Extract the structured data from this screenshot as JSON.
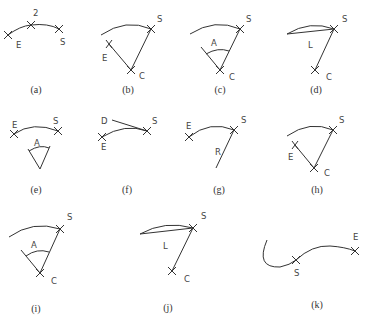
{
  "figure": {
    "panels": [
      {
        "id": "a",
        "caption": "(a)",
        "labels": {
          "p1": "E",
          "p2": "2",
          "p3": "S"
        }
      },
      {
        "id": "b",
        "caption": "(b)",
        "labels": {
          "s": "S",
          "e": "E",
          "c": "C"
        }
      },
      {
        "id": "c",
        "caption": "(c)",
        "labels": {
          "s": "S",
          "a": "A",
          "c": "C"
        }
      },
      {
        "id": "d",
        "caption": "(d)",
        "labels": {
          "s": "S",
          "l": "L",
          "c": "C"
        }
      },
      {
        "id": "e",
        "caption": "(e)",
        "labels": {
          "e": "E",
          "s": "S",
          "a": "A"
        }
      },
      {
        "id": "f",
        "caption": "(f)",
        "labels": {
          "d": "D",
          "s": "S",
          "e": "E"
        }
      },
      {
        "id": "g",
        "caption": "(g)",
        "labels": {
          "e": "E",
          "s": "S",
          "r": "R"
        }
      },
      {
        "id": "h",
        "caption": "(h)",
        "labels": {
          "s": "S",
          "e": "E",
          "c": "C"
        }
      },
      {
        "id": "i",
        "caption": "(i)",
        "labels": {
          "s": "S",
          "a": "A",
          "c": "C"
        }
      },
      {
        "id": "j",
        "caption": "(j)",
        "labels": {
          "s": "S",
          "l": "L",
          "c": "C"
        }
      },
      {
        "id": "k",
        "caption": "(k)",
        "labels": {
          "s": "S",
          "e": "E"
        }
      }
    ]
  }
}
